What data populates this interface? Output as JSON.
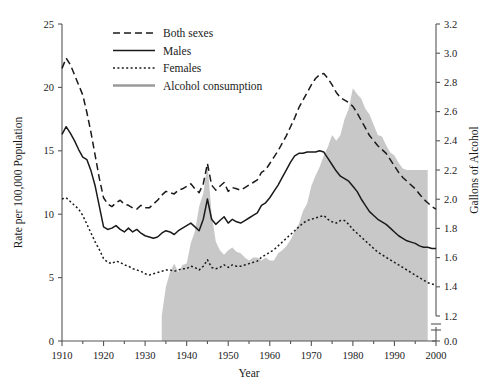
{
  "chart_data": {
    "type": "line",
    "title": "",
    "xlabel": "Year",
    "ylabel": "Rate per 100,000 Population",
    "y2label": "Gallons of Alcohol",
    "xlim": [
      1910,
      2000
    ],
    "ylim": [
      0,
      25
    ],
    "y2lim": [
      1.2,
      3.2
    ],
    "y2_has_axis_break": true,
    "y2_break_labels": [
      "0.0"
    ],
    "grid": false,
    "legend_position": "top-center",
    "xticks": [
      1910,
      1920,
      1930,
      1940,
      1950,
      1960,
      1970,
      1980,
      1990,
      2000
    ],
    "xticks_minor": [
      1915,
      1925,
      1935,
      1945,
      1955,
      1965,
      1975,
      1985,
      1995
    ],
    "yticks": [
      0,
      5,
      10,
      15,
      20,
      25
    ],
    "y2ticks": [
      1.2,
      1.4,
      1.6,
      1.8,
      2.0,
      2.2,
      2.4,
      2.6,
      2.8,
      3.0,
      3.2
    ],
    "y2tick_extra": "0.0",
    "colors": {
      "line": "#1a1a1a",
      "area_fill": "#c8c8c8",
      "area_legend_line": "#9a9a9a",
      "axis": "#555555",
      "text": "#1a1a1a"
    },
    "series": [
      {
        "name": "Both sexes",
        "style": "dashed",
        "axis": "left",
        "x": [
          1910,
          1911,
          1912,
          1913,
          1914,
          1915,
          1916,
          1917,
          1918,
          1919,
          1920,
          1921,
          1922,
          1923,
          1924,
          1925,
          1926,
          1927,
          1928,
          1929,
          1930,
          1931,
          1932,
          1933,
          1934,
          1935,
          1936,
          1937,
          1938,
          1939,
          1940,
          1941,
          1942,
          1943,
          1944,
          1945,
          1946,
          1947,
          1948,
          1949,
          1950,
          1951,
          1952,
          1953,
          1954,
          1955,
          1956,
          1957,
          1958,
          1959,
          1960,
          1961,
          1962,
          1963,
          1964,
          1965,
          1966,
          1967,
          1968,
          1969,
          1970,
          1971,
          1972,
          1973,
          1974,
          1975,
          1976,
          1977,
          1978,
          1979,
          1980,
          1981,
          1982,
          1983,
          1984,
          1985,
          1986,
          1987,
          1988,
          1989,
          1990,
          1991,
          1992,
          1993,
          1994,
          1995,
          1996,
          1997,
          1998,
          1999,
          2000
        ],
        "values": [
          21.5,
          22.3,
          21.8,
          21.0,
          20.2,
          19.4,
          18.0,
          16.4,
          14.6,
          12.8,
          11.3,
          10.8,
          10.6,
          10.9,
          11.1,
          10.8,
          10.7,
          10.5,
          10.4,
          10.7,
          10.5,
          10.5,
          10.8,
          11.1,
          11.5,
          11.8,
          11.7,
          11.6,
          11.9,
          12.0,
          12.2,
          12.4,
          12.0,
          11.7,
          12.4,
          14.0,
          12.3,
          11.9,
          12.2,
          12.5,
          11.8,
          12.1,
          12.0,
          11.9,
          12.1,
          12.3,
          12.5,
          12.7,
          13.3,
          13.5,
          14.0,
          14.5,
          15.0,
          15.6,
          16.2,
          16.9,
          17.6,
          18.4,
          19.0,
          19.6,
          20.2,
          20.7,
          21.0,
          21.1,
          20.7,
          20.2,
          19.6,
          19.2,
          19.0,
          18.8,
          18.5,
          18.0,
          17.4,
          16.8,
          16.2,
          15.8,
          15.4,
          15.1,
          14.8,
          14.3,
          13.8,
          13.3,
          12.9,
          12.6,
          12.3,
          12.0,
          11.6,
          11.2,
          10.9,
          10.6,
          10.4
        ]
      },
      {
        "name": "Males",
        "style": "solid",
        "axis": "left",
        "x": [
          1910,
          1911,
          1912,
          1913,
          1914,
          1915,
          1916,
          1917,
          1918,
          1919,
          1920,
          1921,
          1922,
          1923,
          1924,
          1925,
          1926,
          1927,
          1928,
          1929,
          1930,
          1931,
          1932,
          1933,
          1934,
          1935,
          1936,
          1937,
          1938,
          1939,
          1940,
          1941,
          1942,
          1943,
          1944,
          1945,
          1946,
          1947,
          1948,
          1949,
          1950,
          1951,
          1952,
          1953,
          1954,
          1955,
          1956,
          1957,
          1958,
          1959,
          1960,
          1961,
          1962,
          1963,
          1964,
          1965,
          1966,
          1967,
          1968,
          1969,
          1970,
          1971,
          1972,
          1973,
          1974,
          1975,
          1976,
          1977,
          1978,
          1979,
          1980,
          1981,
          1982,
          1983,
          1984,
          1985,
          1986,
          1987,
          1988,
          1989,
          1990,
          1991,
          1992,
          1993,
          1994,
          1995,
          1996,
          1997,
          1998,
          1999,
          2000
        ],
        "values": [
          16.3,
          16.9,
          16.4,
          15.8,
          15.1,
          14.5,
          14.3,
          13.4,
          12.2,
          10.6,
          9.0,
          8.8,
          8.9,
          9.1,
          8.8,
          8.6,
          8.9,
          8.6,
          8.8,
          8.5,
          8.3,
          8.2,
          8.1,
          8.2,
          8.5,
          8.7,
          8.6,
          8.4,
          8.7,
          8.9,
          9.1,
          9.3,
          9.0,
          8.7,
          9.6,
          11.2,
          9.6,
          9.2,
          9.5,
          9.8,
          9.3,
          9.6,
          9.4,
          9.3,
          9.5,
          9.7,
          9.9,
          10.1,
          10.7,
          10.9,
          11.3,
          11.8,
          12.3,
          12.9,
          13.5,
          14.1,
          14.6,
          14.8,
          14.8,
          14.9,
          14.9,
          14.9,
          15.0,
          14.9,
          14.4,
          13.9,
          13.4,
          13.0,
          12.8,
          12.6,
          12.2,
          11.8,
          11.2,
          10.7,
          10.2,
          9.9,
          9.6,
          9.4,
          9.2,
          8.9,
          8.6,
          8.3,
          8.1,
          7.9,
          7.8,
          7.7,
          7.5,
          7.4,
          7.4,
          7.3,
          7.3
        ]
      },
      {
        "name": "Females",
        "style": "dotted",
        "axis": "left",
        "x": [
          1910,
          1911,
          1912,
          1913,
          1914,
          1915,
          1916,
          1917,
          1918,
          1919,
          1920,
          1921,
          1922,
          1923,
          1924,
          1925,
          1926,
          1927,
          1928,
          1929,
          1930,
          1931,
          1932,
          1933,
          1934,
          1935,
          1936,
          1937,
          1938,
          1939,
          1940,
          1941,
          1942,
          1943,
          1944,
          1945,
          1946,
          1947,
          1948,
          1949,
          1950,
          1951,
          1952,
          1953,
          1954,
          1955,
          1956,
          1957,
          1958,
          1959,
          1960,
          1961,
          1962,
          1963,
          1964,
          1965,
          1966,
          1967,
          1968,
          1969,
          1970,
          1971,
          1972,
          1973,
          1974,
          1975,
          1976,
          1977,
          1978,
          1979,
          1980,
          1981,
          1982,
          1983,
          1984,
          1985,
          1986,
          1987,
          1988,
          1989,
          1990,
          1991,
          1992,
          1993,
          1994,
          1995,
          1996,
          1997,
          1998,
          1999,
          2000
        ],
        "values": [
          11.2,
          11.3,
          11.0,
          10.7,
          10.4,
          9.9,
          9.2,
          8.5,
          7.8,
          7.2,
          6.5,
          6.2,
          6.1,
          6.3,
          6.2,
          6.0,
          5.9,
          5.7,
          5.6,
          5.5,
          5.3,
          5.2,
          5.3,
          5.4,
          5.5,
          5.6,
          5.6,
          5.5,
          5.6,
          5.7,
          5.7,
          5.9,
          5.8,
          5.6,
          5.9,
          6.4,
          5.8,
          5.7,
          5.8,
          6.0,
          5.8,
          6.0,
          5.9,
          5.9,
          6.0,
          6.1,
          6.2,
          6.3,
          6.6,
          6.8,
          7.0,
          7.2,
          7.5,
          7.8,
          8.1,
          8.4,
          8.7,
          9.0,
          9.3,
          9.5,
          9.6,
          9.7,
          9.8,
          9.9,
          9.6,
          9.4,
          9.3,
          9.5,
          9.5,
          9.2,
          8.8,
          8.5,
          8.2,
          7.9,
          7.6,
          7.3,
          7.0,
          6.8,
          6.6,
          6.4,
          6.2,
          6.0,
          5.8,
          5.6,
          5.4,
          5.2,
          5.0,
          4.8,
          4.6,
          4.5,
          4.4
        ]
      },
      {
        "name": "Alcohol consumption",
        "style": "area",
        "axis": "right",
        "x": [
          1934,
          1935,
          1936,
          1937,
          1938,
          1939,
          1940,
          1941,
          1942,
          1943,
          1944,
          1945,
          1946,
          1947,
          1948,
          1949,
          1950,
          1951,
          1952,
          1953,
          1954,
          1955,
          1956,
          1957,
          1958,
          1959,
          1960,
          1961,
          1962,
          1963,
          1964,
          1965,
          1966,
          1967,
          1968,
          1969,
          1970,
          1971,
          1972,
          1973,
          1974,
          1975,
          1976,
          1977,
          1978,
          1979,
          1980,
          1981,
          1982,
          1983,
          1984,
          1985,
          1986,
          1987,
          1988,
          1989,
          1990,
          1991,
          1992,
          1993,
          1994,
          1995,
          1996,
          1997,
          1998
        ],
        "values": [
          1.2,
          1.4,
          1.5,
          1.56,
          1.5,
          1.55,
          1.56,
          1.7,
          1.78,
          1.95,
          2.04,
          2.25,
          1.9,
          1.71,
          1.65,
          1.62,
          1.65,
          1.67,
          1.64,
          1.63,
          1.6,
          1.58,
          1.6,
          1.6,
          1.58,
          1.6,
          1.58,
          1.58,
          1.63,
          1.65,
          1.68,
          1.72,
          1.78,
          1.83,
          1.92,
          1.97,
          2.09,
          2.16,
          2.22,
          2.3,
          2.36,
          2.44,
          2.4,
          2.44,
          2.55,
          2.62,
          2.76,
          2.72,
          2.69,
          2.62,
          2.58,
          2.51,
          2.44,
          2.43,
          2.37,
          2.32,
          2.3,
          2.25,
          2.21,
          2.2,
          2.2,
          2.2,
          2.2,
          2.2,
          2.2
        ]
      }
    ]
  },
  "legend": {
    "items": [
      {
        "label": "Both sexes",
        "style": "dashed"
      },
      {
        "label": "Males",
        "style": "solid"
      },
      {
        "label": "Females",
        "style": "dotted"
      },
      {
        "label": "Alcohol consumption",
        "style": "area-line"
      }
    ]
  },
  "axes": {
    "left_title": "Rate per 100,000 Population",
    "right_title": "Gallons of Alcohol",
    "bottom_title": "Year"
  }
}
